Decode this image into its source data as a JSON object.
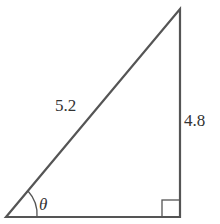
{
  "diagram": {
    "type": "right-triangle",
    "hypotenuse_label": "5.2",
    "opposite_label": "4.8",
    "angle_label": "θ",
    "right_angle_marker": true,
    "stroke_color": "#555555"
  }
}
